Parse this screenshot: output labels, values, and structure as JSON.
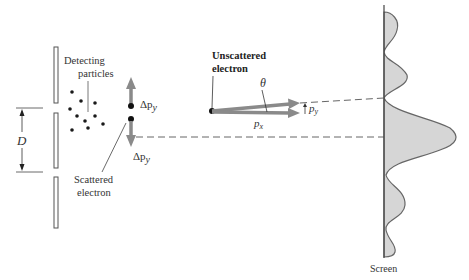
{
  "diagram": {
    "type": "electron-double-slit-uncertainty",
    "labels": {
      "detecting_particles_line1": "Detecting",
      "detecting_particles_line2": "particles",
      "scattered_electron_line1": "Scattered",
      "scattered_electron_line2": "electron",
      "unscattered_electron_line1": "Unscattered",
      "unscattered_electron_line2": "electron",
      "delta_py_top": "Δp",
      "delta_py_top_sub": "y",
      "delta_py_bottom": "Δp",
      "delta_py_bottom_sub": "y",
      "slit_separation": "D",
      "angle": "θ",
      "px": "p",
      "px_sub": "x",
      "py": "p",
      "py_sub": "y",
      "screen": "Screen"
    },
    "colors": {
      "arrow_gray": "#8a8a8a",
      "line": "#555555",
      "screen_fill": "#d6d6d6",
      "dot": "#1a1a1a"
    }
  }
}
